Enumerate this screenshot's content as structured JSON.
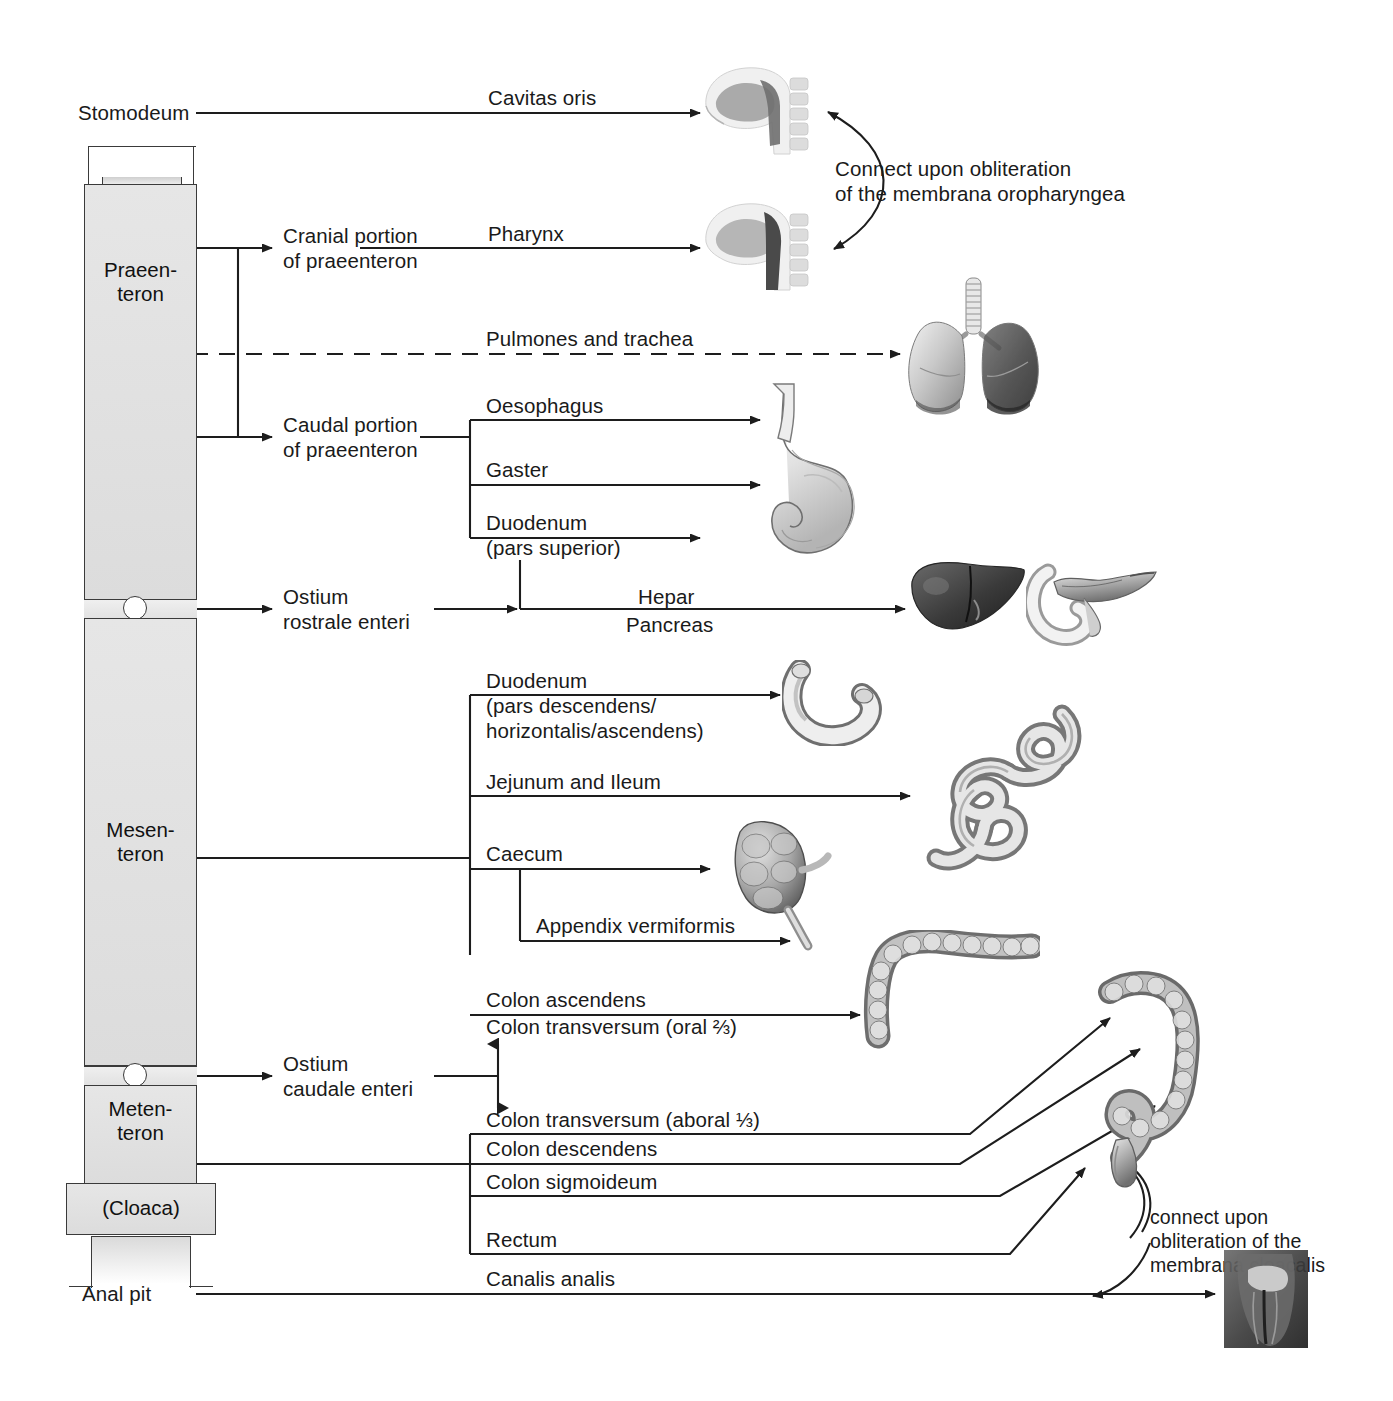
{
  "diagram": {
    "segments": [
      {
        "id": "praeenteron",
        "label": "Praeen-\nteron"
      },
      {
        "id": "mesenteron",
        "label": "Mesen-\nteron"
      },
      {
        "id": "metenteron",
        "label": "Meten-\nteron"
      },
      {
        "id": "cloaca",
        "label": "(Cloaca)"
      }
    ],
    "endpoints": [
      {
        "id": "stomodeum",
        "label": "Stomodeum"
      },
      {
        "id": "anal-pit",
        "label": "Anal pit"
      }
    ],
    "subdivisions": [
      {
        "id": "cranial-praeenteron",
        "label": "Cranial portion\nof praeenteron"
      },
      {
        "id": "caudal-praeenteron",
        "label": "Caudal portion\nof praeenteron"
      },
      {
        "id": "ostium-rostrale",
        "label": "Ostium\nrostrale enteri"
      },
      {
        "id": "ostium-caudale",
        "label": "Ostium\ncaudale enteri"
      }
    ],
    "derivatives": [
      {
        "id": "cavitas-oris",
        "label": "Cavitas oris"
      },
      {
        "id": "pharynx",
        "label": "Pharynx"
      },
      {
        "id": "pulmones-trachea",
        "label": "Pulmones and trachea"
      },
      {
        "id": "oesophagus",
        "label": "Oesophagus"
      },
      {
        "id": "gaster",
        "label": "Gaster"
      },
      {
        "id": "duodenum-superior",
        "label": "Duodenum\n(pars superior)"
      },
      {
        "id": "hepar",
        "label": "Hepar"
      },
      {
        "id": "pancreas",
        "label": "Pancreas"
      },
      {
        "id": "duodenum-desc",
        "label": "Duodenum\n(pars descendens/\nhorizontalis/ascendens)"
      },
      {
        "id": "jejunum-ileum",
        "label": "Jejunum and Ileum"
      },
      {
        "id": "caecum",
        "label": "Caecum"
      },
      {
        "id": "appendix-vermiformis",
        "label": "Appendix vermiformis"
      },
      {
        "id": "colon-ascendens",
        "label": "Colon ascendens"
      },
      {
        "id": "colon-transversum-oral",
        "label": "Colon transversum (oral ⅔)"
      },
      {
        "id": "colon-transversum-aboral",
        "label": "Colon transversum (aboral ⅓)"
      },
      {
        "id": "colon-descendens",
        "label": "Colon descendens"
      },
      {
        "id": "colon-sigmoideum",
        "label": "Colon sigmoideum"
      },
      {
        "id": "rectum",
        "label": "Rectum"
      },
      {
        "id": "canalis-analis",
        "label": "Canalis analis"
      }
    ],
    "annotations": [
      {
        "id": "oropharyngea-note",
        "label": "Connect upon obliteration\nof the membrana oropharyngea"
      },
      {
        "id": "cloacalis-note",
        "label": "connect upon\nobliteration of the\nmembrana cloacalis"
      }
    ],
    "illustrations": [
      {
        "id": "head-sagittal-oral",
        "label": "head-sagittal-section"
      },
      {
        "id": "head-sagittal-pharynx",
        "label": "head-sagittal-section"
      },
      {
        "id": "lungs-trachea",
        "label": "lungs-and-trachea"
      },
      {
        "id": "stomach-oesophagus",
        "label": "stomach-with-oesophagus"
      },
      {
        "id": "liver",
        "label": "liver"
      },
      {
        "id": "pancreas-duodenum",
        "label": "pancreas-with-duodenum"
      },
      {
        "id": "duodenum-loop",
        "label": "duodenal-loop"
      },
      {
        "id": "small-intestine",
        "label": "jejunum-ileum-coils"
      },
      {
        "id": "caecum-appendix",
        "label": "caecum-with-appendix"
      },
      {
        "id": "colon-proximal",
        "label": "ascending-transverse-colon"
      },
      {
        "id": "colon-distal",
        "label": "descending-sigmoid-rectum"
      },
      {
        "id": "anal-canal",
        "label": "anal-canal"
      }
    ],
    "colors": {
      "stroke": "#1d1d1d",
      "fill": "#e4e4e4",
      "text": "#1a1a1a"
    }
  }
}
